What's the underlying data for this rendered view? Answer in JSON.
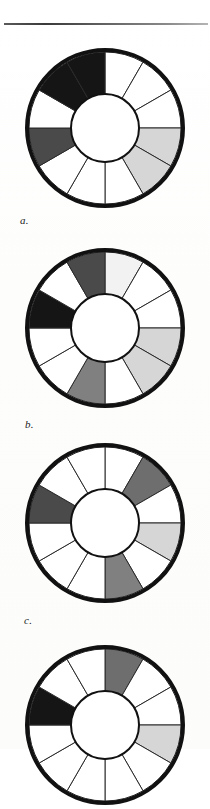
{
  "page": {
    "kind": "book-page-figure-plate",
    "background_color": "#fefefd",
    "width": 210,
    "height": 749,
    "rule_color": "#3a3a3a"
  },
  "palette": {
    "black": "#151515",
    "dark_gray": "#4a4a4a",
    "mid_gray": "#808080",
    "mid_dark_gray": "#6e6e6e",
    "light_gray": "#d6d6d6",
    "white": "#ffffff",
    "outline": "#111111",
    "spoke": "#2a2a2a"
  },
  "figures": [
    {
      "id": "wheel-a",
      "label": "a.",
      "label_x": 20,
      "label_y": 214,
      "center_x": 105,
      "center_y": 128,
      "outer_radius": 76,
      "inner_radius": 34,
      "rim_width": 4,
      "segment_count": 12,
      "start_angle": -90,
      "segments": [
        {
          "index": 0,
          "from": -90,
          "to": -60,
          "fill": "#ffffff"
        },
        {
          "index": 1,
          "from": -60,
          "to": -30,
          "fill": "#ffffff"
        },
        {
          "index": 2,
          "from": -30,
          "to": 0,
          "fill": "#ffffff"
        },
        {
          "index": 3,
          "from": 0,
          "to": 30,
          "fill": "#d6d6d6"
        },
        {
          "index": 4,
          "from": 30,
          "to": 60,
          "fill": "#d6d6d6"
        },
        {
          "index": 5,
          "from": 60,
          "to": 90,
          "fill": "#ffffff"
        },
        {
          "index": 6,
          "from": 90,
          "to": 120,
          "fill": "#ffffff"
        },
        {
          "index": 7,
          "from": 120,
          "to": 150,
          "fill": "#ffffff"
        },
        {
          "index": 8,
          "from": 150,
          "to": 180,
          "fill": "#4a4a4a"
        },
        {
          "index": 9,
          "from": 180,
          "to": 210,
          "fill": "#ffffff"
        },
        {
          "index": 10,
          "from": 210,
          "to": 240,
          "fill": "#151515"
        },
        {
          "index": 11,
          "from": 240,
          "to": 270,
          "fill": "#151515"
        }
      ]
    },
    {
      "id": "wheel-b",
      "label": "b.",
      "label_x": 25,
      "label_y": 418,
      "center_x": 105,
      "center_y": 328,
      "outer_radius": 76,
      "inner_radius": 34,
      "rim_width": 4,
      "segment_count": 12,
      "start_angle": -90,
      "segments": [
        {
          "index": 0,
          "from": -90,
          "to": -60,
          "fill": "#f2f2f2"
        },
        {
          "index": 1,
          "from": -60,
          "to": -30,
          "fill": "#ffffff"
        },
        {
          "index": 2,
          "from": -30,
          "to": 0,
          "fill": "#ffffff"
        },
        {
          "index": 3,
          "from": 0,
          "to": 30,
          "fill": "#d6d6d6"
        },
        {
          "index": 4,
          "from": 30,
          "to": 60,
          "fill": "#d6d6d6"
        },
        {
          "index": 5,
          "from": 60,
          "to": 90,
          "fill": "#ffffff"
        },
        {
          "index": 6,
          "from": 90,
          "to": 120,
          "fill": "#808080"
        },
        {
          "index": 7,
          "from": 120,
          "to": 150,
          "fill": "#ffffff"
        },
        {
          "index": 8,
          "from": 150,
          "to": 180,
          "fill": "#ffffff"
        },
        {
          "index": 9,
          "from": 180,
          "to": 210,
          "fill": "#151515"
        },
        {
          "index": 10,
          "from": 210,
          "to": 240,
          "fill": "#ffffff"
        },
        {
          "index": 11,
          "from": 240,
          "to": 270,
          "fill": "#4a4a4a"
        }
      ]
    },
    {
      "id": "wheel-c",
      "label": "c.",
      "label_x": 24,
      "label_y": 614,
      "center_x": 105,
      "center_y": 523,
      "outer_radius": 76,
      "inner_radius": 34,
      "rim_width": 4,
      "segment_count": 12,
      "start_angle": -90,
      "segments": [
        {
          "index": 0,
          "from": -90,
          "to": -60,
          "fill": "#ffffff"
        },
        {
          "index": 1,
          "from": -60,
          "to": -30,
          "fill": "#6e6e6e"
        },
        {
          "index": 2,
          "from": -30,
          "to": 0,
          "fill": "#ffffff"
        },
        {
          "index": 3,
          "from": 0,
          "to": 30,
          "fill": "#d6d6d6"
        },
        {
          "index": 4,
          "from": 30,
          "to": 60,
          "fill": "#ffffff"
        },
        {
          "index": 5,
          "from": 60,
          "to": 90,
          "fill": "#808080"
        },
        {
          "index": 6,
          "from": 90,
          "to": 120,
          "fill": "#ffffff"
        },
        {
          "index": 7,
          "from": 120,
          "to": 150,
          "fill": "#ffffff"
        },
        {
          "index": 8,
          "from": 150,
          "to": 180,
          "fill": "#ffffff"
        },
        {
          "index": 9,
          "from": 180,
          "to": 210,
          "fill": "#4a4a4a"
        },
        {
          "index": 10,
          "from": 210,
          "to": 240,
          "fill": "#ffffff"
        },
        {
          "index": 11,
          "from": 240,
          "to": 270,
          "fill": "#ffffff"
        }
      ]
    },
    {
      "id": "wheel-d",
      "label": "",
      "label_x": 0,
      "label_y": 0,
      "center_x": 105,
      "center_y": 725,
      "outer_radius": 76,
      "inner_radius": 34,
      "rim_width": 4,
      "segment_count": 12,
      "start_angle": -90,
      "clipped_bottom": true,
      "segments": [
        {
          "index": 0,
          "from": -90,
          "to": -60,
          "fill": "#6e6e6e"
        },
        {
          "index": 1,
          "from": -60,
          "to": -30,
          "fill": "#ffffff"
        },
        {
          "index": 2,
          "from": -30,
          "to": 0,
          "fill": "#ffffff"
        },
        {
          "index": 3,
          "from": 0,
          "to": 30,
          "fill": "#d6d6d6"
        },
        {
          "index": 4,
          "from": 30,
          "to": 60,
          "fill": "#ffffff"
        },
        {
          "index": 5,
          "from": 60,
          "to": 90,
          "fill": "#ffffff"
        },
        {
          "index": 6,
          "from": 90,
          "to": 120,
          "fill": "#ffffff"
        },
        {
          "index": 7,
          "from": 120,
          "to": 150,
          "fill": "#ffffff"
        },
        {
          "index": 8,
          "from": 150,
          "to": 180,
          "fill": "#ffffff"
        },
        {
          "index": 9,
          "from": 180,
          "to": 210,
          "fill": "#151515"
        },
        {
          "index": 10,
          "from": 210,
          "to": 240,
          "fill": "#ffffff"
        },
        {
          "index": 11,
          "from": 240,
          "to": 270,
          "fill": "#ffffff"
        }
      ]
    }
  ]
}
